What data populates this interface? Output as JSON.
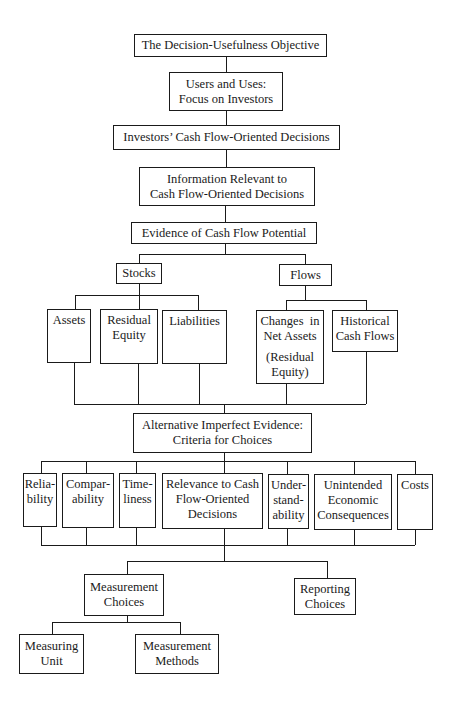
{
  "diagram": {
    "type": "hierarchy-flowchart",
    "line_color": "#1a1a1a",
    "background": "#ffffff",
    "nodes": {
      "objective": {
        "lines": [
          "The Decision-Usefulness Objective"
        ]
      },
      "users": {
        "lines": [
          "Users and Uses:",
          "Focus on Investors"
        ]
      },
      "investors_decisions": {
        "lines": [
          "Investors’ Cash Flow-Oriented Decisions"
        ]
      },
      "information_relevant": {
        "lines": [
          "Information Relevant to",
          "Cash Flow-Oriented Decisions"
        ]
      },
      "evidence": {
        "lines": [
          "Evidence of Cash Flow Potential"
        ]
      },
      "stocks": {
        "lines": [
          "Stocks"
        ]
      },
      "flows": {
        "lines": [
          "Flows"
        ]
      },
      "assets": {
        "lines": [
          "Assets"
        ]
      },
      "residual_equity": {
        "lines": [
          "Residual",
          "Equity"
        ]
      },
      "liabilities": {
        "lines": [
          "Liabilities"
        ]
      },
      "changes_net_assets": {
        "lines": [
          "Changes  in",
          "Net Assets",
          "(Residual",
          "Equity)"
        ]
      },
      "historical_cash_flows": {
        "lines": [
          "Historical",
          "Cash Flows"
        ]
      },
      "alternative_evidence": {
        "lines": [
          "Alternative Imperfect Evidence:",
          "Criteria for Choices"
        ]
      },
      "reliability": {
        "lines": [
          "Relia-",
          "bility"
        ]
      },
      "comparability": {
        "lines": [
          "Compar-",
          "ability"
        ]
      },
      "timeliness": {
        "lines": [
          "Time-",
          "liness"
        ]
      },
      "relevance": {
        "lines": [
          "Relevance to Cash",
          "Flow-Oriented",
          "Decisions"
        ]
      },
      "understandability": {
        "lines": [
          "Under-",
          "stand-",
          "ability"
        ]
      },
      "unintended": {
        "lines": [
          "Unintended",
          "Economic",
          "Consequences"
        ]
      },
      "costs": {
        "lines": [
          "Costs"
        ]
      },
      "measurement_choices": {
        "lines": [
          "Measurement",
          "Choices"
        ]
      },
      "reporting_choices": {
        "lines": [
          "Reporting",
          "Choices"
        ]
      },
      "measuring_unit": {
        "lines": [
          "Measuring",
          "Unit"
        ]
      },
      "measurement_methods": {
        "lines": [
          "Measurement",
          "Methods"
        ]
      }
    },
    "edges": [
      [
        "objective",
        "users"
      ],
      [
        "users",
        "investors_decisions"
      ],
      [
        "investors_decisions",
        "information_relevant"
      ],
      [
        "information_relevant",
        "evidence"
      ],
      [
        "evidence",
        "stocks"
      ],
      [
        "evidence",
        "flows"
      ],
      [
        "stocks",
        "assets"
      ],
      [
        "stocks",
        "residual_equity"
      ],
      [
        "stocks",
        "liabilities"
      ],
      [
        "flows",
        "changes_net_assets"
      ],
      [
        "flows",
        "historical_cash_flows"
      ],
      [
        "assets",
        "alternative_evidence"
      ],
      [
        "residual_equity",
        "alternative_evidence"
      ],
      [
        "liabilities",
        "alternative_evidence"
      ],
      [
        "changes_net_assets",
        "alternative_evidence"
      ],
      [
        "historical_cash_flows",
        "alternative_evidence"
      ],
      [
        "alternative_evidence",
        "reliability"
      ],
      [
        "alternative_evidence",
        "comparability"
      ],
      [
        "alternative_evidence",
        "timeliness"
      ],
      [
        "alternative_evidence",
        "relevance"
      ],
      [
        "alternative_evidence",
        "understandability"
      ],
      [
        "alternative_evidence",
        "unintended"
      ],
      [
        "alternative_evidence",
        "costs"
      ],
      [
        "reliability",
        "measurement_choices"
      ],
      [
        "comparability",
        "measurement_choices"
      ],
      [
        "timeliness",
        "measurement_choices"
      ],
      [
        "relevance",
        "measurement_choices"
      ],
      [
        "understandability",
        "measurement_choices"
      ],
      [
        "unintended",
        "measurement_choices"
      ],
      [
        "costs",
        "measurement_choices"
      ],
      [
        "reliability",
        "reporting_choices"
      ],
      [
        "comparability",
        "reporting_choices"
      ],
      [
        "timeliness",
        "reporting_choices"
      ],
      [
        "relevance",
        "reporting_choices"
      ],
      [
        "understandability",
        "reporting_choices"
      ],
      [
        "unintended",
        "reporting_choices"
      ],
      [
        "costs",
        "reporting_choices"
      ],
      [
        "measurement_choices",
        "measuring_unit"
      ],
      [
        "measurement_choices",
        "measurement_methods"
      ]
    ]
  }
}
